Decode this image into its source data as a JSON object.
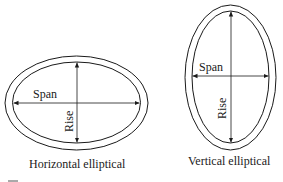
{
  "figures": [
    {
      "caption": "Horizontal elliptical",
      "span_label": "Span",
      "rise_label": "Rise"
    },
    {
      "caption": "Vertical elliptical",
      "span_label": "Span",
      "rise_label": "Rise"
    }
  ],
  "colors": {
    "stroke": "#1a1a1a",
    "background": "#ffffff"
  }
}
